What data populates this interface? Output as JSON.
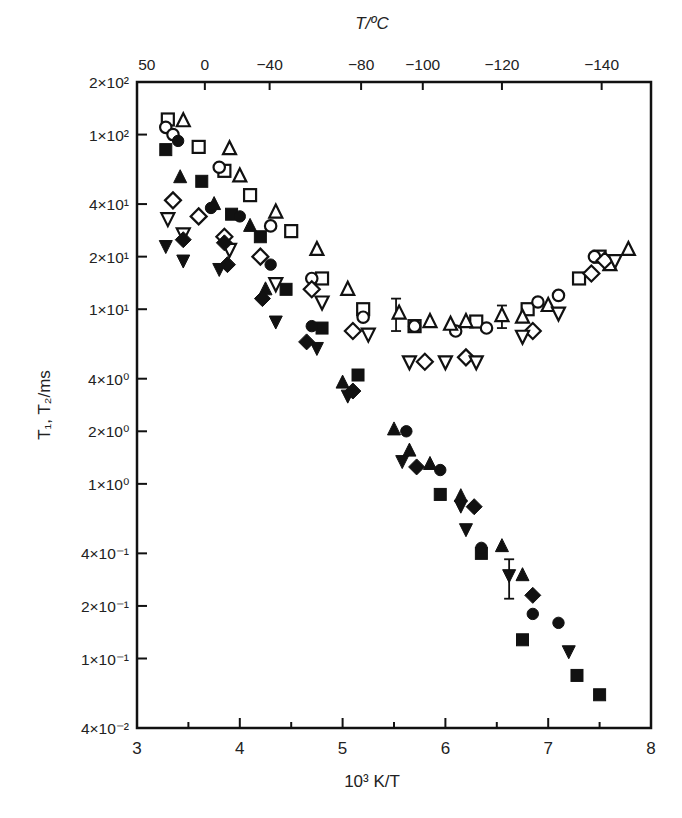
{
  "chart_data": {
    "type": "scatter",
    "title": "",
    "xlabel": "10^3 K/T",
    "ylabel": "T1, T2/ms",
    "top_xlabel": "T/ºC",
    "xlim": [
      3,
      8
    ],
    "ylim": [
      0.04,
      200
    ],
    "yscale": "log",
    "grid": false,
    "legend": "none",
    "x_ticks": [
      3,
      4,
      5,
      6,
      7,
      8
    ],
    "x_minor_ticks": [
      3.5,
      4.5,
      5.5,
      6.5,
      7.5
    ],
    "y_ticks": [
      {
        "value": 200,
        "label": "2×10²"
      },
      {
        "value": 100,
        "label": "1×10²"
      },
      {
        "value": 40,
        "label": "4×10¹"
      },
      {
        "value": 20,
        "label": "2×10¹"
      },
      {
        "value": 10,
        "label": "1×10¹"
      },
      {
        "value": 4,
        "label": "4×10⁰"
      },
      {
        "value": 2,
        "label": "2×10⁰"
      },
      {
        "value": 1,
        "label": "1×10⁰"
      },
      {
        "value": 0.4,
        "label": "4×10⁻¹"
      },
      {
        "value": 0.2,
        "label": "2×10⁻¹"
      },
      {
        "value": 0.1,
        "label": "1×10⁻¹"
      },
      {
        "value": 0.04,
        "label": "4×10⁻²"
      }
    ],
    "top_ticks": [
      {
        "label": "50",
        "x": 3.095
      },
      {
        "label": "0",
        "x": 3.66
      },
      {
        "label": "−40",
        "x": 4.29
      },
      {
        "label": "−80",
        "x": 5.18
      },
      {
        "label": "−100",
        "x": 5.78
      },
      {
        "label": "−120",
        "x": 6.55
      },
      {
        "label": "−140",
        "x": 7.52
      }
    ],
    "series": [
      {
        "name": "T1 open square",
        "marker": "square",
        "filled": false,
        "points": [
          [
            3.3,
            122
          ],
          [
            3.6,
            85
          ],
          [
            3.85,
            62
          ],
          [
            4.1,
            45
          ],
          [
            4.5,
            28
          ],
          [
            4.8,
            15
          ],
          [
            5.2,
            10
          ],
          [
            5.7,
            8
          ],
          [
            6.3,
            8.5
          ],
          [
            6.8,
            10
          ],
          [
            7.3,
            15
          ],
          [
            7.5,
            20
          ]
        ]
      },
      {
        "name": "T1 open circle",
        "marker": "circle",
        "filled": false,
        "points": [
          [
            3.28,
            110
          ],
          [
            3.35,
            100
          ],
          [
            3.8,
            65
          ],
          [
            4.3,
            30
          ],
          [
            4.7,
            15
          ],
          [
            5.2,
            9
          ],
          [
            5.7,
            8
          ],
          [
            6.1,
            7.5
          ],
          [
            6.4,
            7.8
          ],
          [
            6.9,
            11
          ],
          [
            7.1,
            12
          ],
          [
            7.45,
            20
          ]
        ]
      },
      {
        "name": "T1 open triangle",
        "marker": "triangle-up",
        "filled": false,
        "points": [
          [
            3.45,
            120
          ],
          [
            3.9,
            83
          ],
          [
            4.0,
            58
          ],
          [
            4.35,
            36
          ],
          [
            4.75,
            22
          ],
          [
            5.05,
            13
          ],
          [
            5.55,
            9.5
          ],
          [
            5.85,
            8.5
          ],
          [
            6.05,
            8.2
          ],
          [
            6.2,
            8.5
          ],
          [
            6.55,
            9.2
          ],
          [
            6.75,
            9
          ],
          [
            7.0,
            10.5
          ],
          [
            7.6,
            18
          ],
          [
            7.78,
            22
          ]
        ]
      },
      {
        "name": "T1 open diamond",
        "marker": "diamond",
        "filled": false,
        "points": [
          [
            3.35,
            42
          ],
          [
            3.6,
            34
          ],
          [
            3.85,
            26
          ],
          [
            4.2,
            20
          ],
          [
            4.7,
            13
          ],
          [
            5.1,
            7.5
          ],
          [
            5.8,
            5.0
          ],
          [
            6.2,
            5.3
          ],
          [
            6.85,
            7.5
          ],
          [
            7.42,
            16
          ],
          [
            7.55,
            19
          ]
        ]
      },
      {
        "name": "T2 open inverted triangle",
        "marker": "triangle-down",
        "filled": false,
        "points": [
          [
            3.3,
            33
          ],
          [
            3.45,
            27
          ],
          [
            3.9,
            22
          ],
          [
            4.35,
            14
          ],
          [
            4.8,
            11
          ],
          [
            5.25,
            7.2
          ],
          [
            5.65,
            5.0
          ],
          [
            6.0,
            5.0
          ],
          [
            6.3,
            5.0
          ],
          [
            6.75,
            7.0
          ],
          [
            7.1,
            9.5
          ],
          [
            7.65,
            19
          ]
        ]
      },
      {
        "name": "T1 filled square",
        "marker": "square",
        "filled": true,
        "points": [
          [
            3.28,
            82
          ],
          [
            3.63,
            54
          ],
          [
            3.92,
            35
          ],
          [
            4.2,
            26
          ],
          [
            4.45,
            13
          ],
          [
            4.8,
            7.8
          ],
          [
            5.15,
            4.2
          ],
          [
            5.95,
            0.87
          ],
          [
            6.35,
            0.4
          ],
          [
            6.75,
            0.128
          ],
          [
            7.28,
            0.08
          ],
          [
            7.5,
            0.062
          ]
        ]
      },
      {
        "name": "T1 filled circle",
        "marker": "circle",
        "filled": true,
        "points": [
          [
            3.4,
            92
          ],
          [
            3.72,
            38
          ],
          [
            4.0,
            34
          ],
          [
            4.3,
            18
          ],
          [
            4.7,
            8.0
          ],
          [
            5.62,
            2.0
          ],
          [
            5.95,
            1.2
          ],
          [
            6.35,
            0.43
          ],
          [
            6.85,
            0.18
          ],
          [
            7.1,
            0.16
          ]
        ]
      },
      {
        "name": "T1 filled triangle",
        "marker": "triangle-up",
        "filled": true,
        "points": [
          [
            3.42,
            57
          ],
          [
            3.75,
            40
          ],
          [
            4.1,
            30
          ],
          [
            4.25,
            13
          ],
          [
            5.0,
            3.8
          ],
          [
            5.5,
            2.05
          ],
          [
            5.65,
            1.55
          ],
          [
            5.85,
            1.3
          ],
          [
            6.15,
            0.85
          ],
          [
            6.55,
            0.44
          ],
          [
            6.75,
            0.3
          ]
        ]
      },
      {
        "name": "T1 filled diamond",
        "marker": "diamond",
        "filled": true,
        "points": [
          [
            3.45,
            25
          ],
          [
            3.85,
            24
          ],
          [
            3.88,
            18
          ],
          [
            4.22,
            11.5
          ],
          [
            4.65,
            6.5
          ],
          [
            5.1,
            3.4
          ],
          [
            5.72,
            1.25
          ],
          [
            6.28,
            0.74
          ],
          [
            6.85,
            0.23
          ]
        ]
      },
      {
        "name": "T2 filled inverted triangle",
        "marker": "triangle-down",
        "filled": true,
        "points": [
          [
            3.28,
            23
          ],
          [
            3.45,
            19
          ],
          [
            3.8,
            17
          ],
          [
            4.35,
            8.5
          ],
          [
            4.75,
            6.0
          ],
          [
            5.05,
            3.2
          ],
          [
            5.58,
            1.35
          ],
          [
            6.15,
            0.75
          ],
          [
            6.2,
            0.55
          ],
          [
            6.62,
            0.3
          ],
          [
            7.2,
            0.11
          ]
        ]
      }
    ],
    "error_bars": [
      {
        "x": 5.52,
        "y": 9.5,
        "ylow": 7.5,
        "yhigh": 11.5
      },
      {
        "x": 6.55,
        "y": 9.0,
        "ylow": 7.8,
        "yhigh": 10.5
      },
      {
        "x": 6.62,
        "y": 0.31,
        "ylow": 0.22,
        "yhigh": 0.37
      }
    ]
  },
  "labels": {
    "top_axis_title": "T/ºC",
    "bottom_axis_title": "10³ K/T",
    "left_axis_title": "T₁, T₂/ms"
  }
}
